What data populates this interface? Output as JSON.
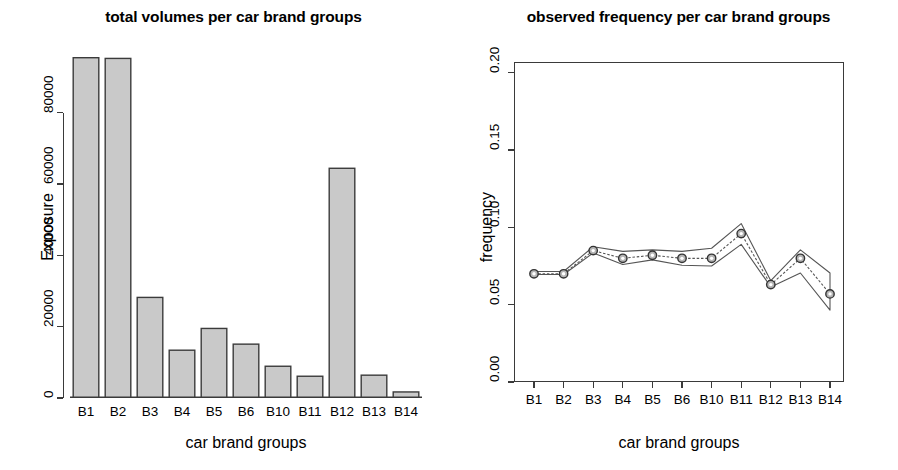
{
  "figure": {
    "width": 898,
    "height": 470,
    "background": "#ffffff",
    "bar_fill": "#c9c9c9",
    "line_color": "#555555",
    "axis_color": "#3a3a3a"
  },
  "panels": {
    "left": {
      "title": "total volumes per car brand groups",
      "xlabel": "car brand groups",
      "ylabel": "Exposure"
    },
    "right": {
      "title": "observed frequency per car brand groups",
      "xlabel": "car brand groups",
      "ylabel": "frequency"
    }
  },
  "chart_data": [
    {
      "type": "bar",
      "title": "total volumes per car brand groups",
      "xlabel": "car brand groups",
      "ylabel": "Exposure",
      "categories": [
        "B1",
        "B2",
        "B3",
        "B4",
        "B5",
        "B6",
        "B10",
        "B11",
        "B12",
        "B13",
        "B14"
      ],
      "values": [
        95400,
        95200,
        28200,
        13400,
        19500,
        15100,
        8900,
        6100,
        64400,
        6400,
        1700
      ],
      "ylim": [
        0,
        97000
      ],
      "yticks": [
        0,
        20000,
        40000,
        60000,
        80000
      ],
      "ytick_labels": [
        "0",
        "20000",
        "40000",
        "60000",
        "80000"
      ],
      "grid": false,
      "legend": "none",
      "box": "left-bottom-axes"
    },
    {
      "type": "line",
      "title": "observed frequency per car brand groups",
      "xlabel": "car brand groups",
      "ylabel": "frequency",
      "categories": [
        "B1",
        "B2",
        "B3",
        "B4",
        "B5",
        "B6",
        "B10",
        "B11",
        "B12",
        "B13",
        "B14"
      ],
      "ylim": [
        0.0,
        0.207
      ],
      "yticks": [
        0.0,
        0.05,
        0.1,
        0.15,
        0.2
      ],
      "ytick_labels": [
        "0.00",
        "0.05",
        "0.10",
        "0.15",
        "0.20"
      ],
      "grid": false,
      "legend": "none",
      "box": "full-frame",
      "series": [
        {
          "name": "observed frequency",
          "marker": "circle",
          "values": [
            0.07,
            0.07,
            0.085,
            0.08,
            0.082,
            0.08,
            0.08,
            0.096,
            0.063,
            0.08,
            0.057
          ]
        },
        {
          "name": "upper confidence bound",
          "marker": "none",
          "values": [
            0.0715,
            0.0715,
            0.0875,
            0.0845,
            0.0855,
            0.0845,
            0.0865,
            0.1025,
            0.0655,
            0.0855,
            0.0705
          ]
        },
        {
          "name": "lower confidence bound",
          "marker": "none",
          "values": [
            0.0695,
            0.0695,
            0.0835,
            0.076,
            0.079,
            0.0755,
            0.075,
            0.089,
            0.0615,
            0.0705,
            0.0465
          ]
        }
      ]
    }
  ]
}
